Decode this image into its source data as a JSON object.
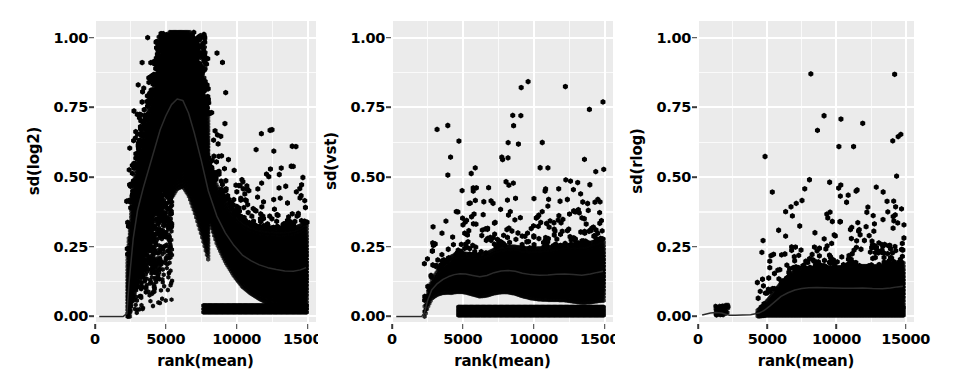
{
  "figure": {
    "background": "#ffffff",
    "panel_background": "#ebebeb",
    "gridline_color": "#ffffff",
    "point_color": "#000000",
    "trendline_color": "#2b2b2b",
    "width": 977,
    "height": 386
  },
  "chart_data": [
    {
      "type": "scatter",
      "subtype": "hexbin-density",
      "title": "",
      "xlabel": "rank(mean)",
      "ylabel": "sd(log2)",
      "xlim": [
        0,
        15600
      ],
      "ylim": [
        -0.02,
        1.06
      ],
      "xticks": [
        0,
        5000,
        10000,
        15000
      ],
      "xticklabels": [
        "0",
        "5000",
        "10000",
        "15000"
      ],
      "yticks": [
        0.0,
        0.25,
        0.5,
        0.75,
        1.0
      ],
      "yticklabels": [
        "0.00",
        "0.25",
        "0.50",
        "0.75",
        "1.00"
      ],
      "grid": true,
      "legend": "none",
      "trendline": {
        "name": "running median",
        "x": [
          300,
          1200,
          2000,
          2250,
          2400,
          2700,
          3000,
          3400,
          3800,
          4200,
          4600,
          5000,
          5400,
          5800,
          6200,
          6600,
          7000,
          7500,
          8000,
          8600,
          9200,
          9800,
          10400,
          11000,
          11600,
          12200,
          12800,
          13400,
          14000,
          14500,
          14900
        ],
        "y": [
          0.0,
          0.0,
          0.0,
          0.01,
          0.12,
          0.28,
          0.38,
          0.46,
          0.53,
          0.6,
          0.67,
          0.72,
          0.76,
          0.78,
          0.775,
          0.73,
          0.66,
          0.56,
          0.45,
          0.36,
          0.3,
          0.255,
          0.22,
          0.2,
          0.185,
          0.175,
          0.168,
          0.163,
          0.162,
          0.167,
          0.175
        ]
      },
      "density_core": {
        "x_range": [
          2300,
          14900
        ],
        "note": "dense black hexbin mass"
      }
    },
    {
      "type": "scatter",
      "subtype": "hexbin-density",
      "title": "",
      "xlabel": "rank(mean)",
      "ylabel": "sd(vst)",
      "xlim": [
        0,
        15600
      ],
      "ylim": [
        -0.02,
        1.06
      ],
      "xticks": [
        0,
        5000,
        10000,
        15000
      ],
      "xticklabels": [
        "0",
        "5000",
        "10000",
        "15000"
      ],
      "yticks": [
        0.0,
        0.25,
        0.5,
        0.75,
        1.0
      ],
      "yticklabels": [
        "0.00",
        "0.25",
        "0.50",
        "0.75",
        "1.00"
      ],
      "grid": true,
      "legend": "none",
      "trendline": {
        "name": "running median",
        "x": [
          300,
          1400,
          2100,
          2300,
          2500,
          2800,
          3200,
          3600,
          4000,
          4400,
          4800,
          5200,
          5700,
          6200,
          6700,
          7200,
          7700,
          8200,
          8700,
          9200,
          9800,
          10400,
          11000,
          11600,
          12200,
          12800,
          13400,
          14000,
          14500,
          14900
        ],
        "y": [
          0.0,
          0.0,
          0.0,
          0.015,
          0.055,
          0.095,
          0.118,
          0.133,
          0.143,
          0.15,
          0.153,
          0.152,
          0.147,
          0.142,
          0.147,
          0.157,
          0.163,
          0.165,
          0.162,
          0.155,
          0.15,
          0.148,
          0.149,
          0.151,
          0.152,
          0.15,
          0.148,
          0.152,
          0.158,
          0.162
        ]
      },
      "density_core": {
        "x_range": [
          2300,
          14900
        ],
        "note": "dense black hexbin mass"
      }
    },
    {
      "type": "scatter",
      "subtype": "hexbin-density",
      "title": "",
      "xlabel": "rank(mean)",
      "ylabel": "sd(rlog)",
      "xlim": [
        0,
        15600
      ],
      "ylim": [
        -0.02,
        1.06
      ],
      "xticks": [
        0,
        5000,
        10000,
        15000
      ],
      "xticklabels": [
        "0",
        "5000",
        "10000",
        "15000"
      ],
      "yticks": [
        0.0,
        0.25,
        0.5,
        0.75,
        1.0
      ],
      "yticklabels": [
        "0.00",
        "0.25",
        "0.50",
        "0.75",
        "1.00"
      ],
      "grid": true,
      "legend": "none",
      "trendline": {
        "name": "running median",
        "x": [
          300,
          900,
          1300,
          1700,
          2000,
          2300,
          2700,
          3200,
          3800,
          4400,
          4800,
          5200,
          5600,
          6000,
          6500,
          7000,
          7500,
          8000,
          8600,
          9200,
          9800,
          10500,
          11200,
          11900,
          12600,
          13300,
          13900,
          14400,
          14800
        ],
        "y": [
          0.005,
          0.012,
          0.014,
          0.012,
          0.008,
          0.004,
          0.004,
          0.005,
          0.006,
          0.012,
          0.022,
          0.038,
          0.055,
          0.072,
          0.085,
          0.095,
          0.1,
          0.103,
          0.104,
          0.103,
          0.102,
          0.101,
          0.101,
          0.102,
          0.1,
          0.099,
          0.102,
          0.106,
          0.108
        ]
      },
      "density_core": {
        "x_range": [
          4400,
          14800
        ],
        "note": "dense black hexbin mass"
      }
    }
  ]
}
